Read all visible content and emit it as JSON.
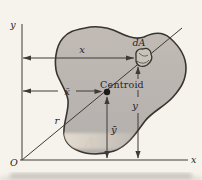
{
  "figure": {
    "background": "#f6f3ed",
    "colors": {
      "blob_top": "#c2bbb5",
      "blob_bottom": "#b3afac",
      "blob_edge": "#383430",
      "band": "#ebe2d4",
      "line": "#3e3a35",
      "text": "#26231f",
      "area_label": "#d8c8b8",
      "dot": "#1c1b1a",
      "smudge": "#8f8880"
    },
    "axes": {
      "y_label": "y",
      "x_label": "x",
      "origin_label": "O"
    },
    "labels": {
      "element": "dA",
      "centroid": "Centroid",
      "radial": "r",
      "area": "A"
    },
    "dimensions": {
      "x": "x",
      "xbar": "x̄",
      "y": "y",
      "ybar": "ȳ"
    }
  }
}
